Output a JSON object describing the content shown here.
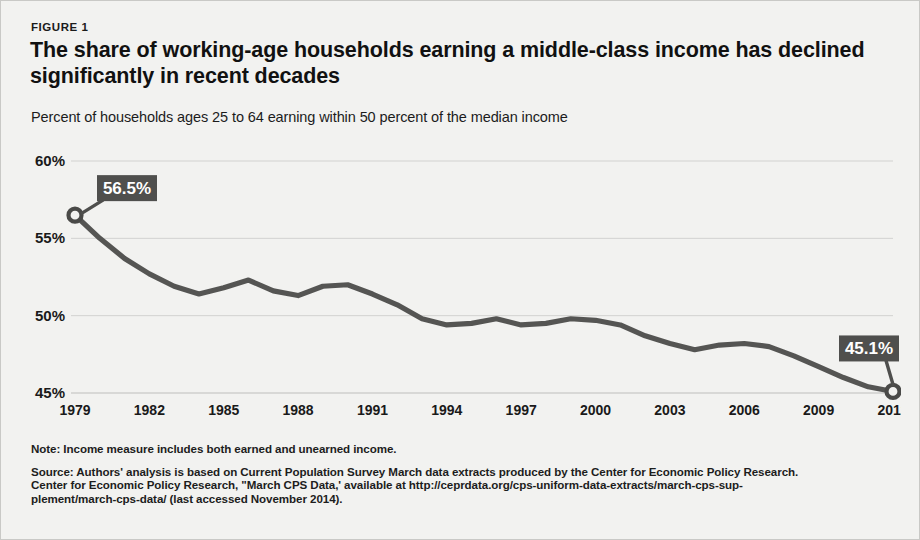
{
  "figure": {
    "label": "FIGURE 1",
    "title": "The share of working-age households earning a middle-class income has declined significantly in recent decades",
    "subtitle": "Percent of households ages 25 to 64 earning within 50 percent of the median income"
  },
  "notes": {
    "note": "Note:  Income measure includes both earned and unearned income.",
    "source_line_1": "Source: Authors' analysis is based on Current Population Survey March data extracts produced by the Center for Economic Policy Research.",
    "source_line_2": "Center for Economic Policy Research, \"March CPS Data,' available at http://ceprdata.org/cps-uniform-data-extracts/march-cps-sup-",
    "source_line_3": "plement/march-cps-data/  (last accessed November 2014)."
  },
  "colors": {
    "line": "#555553",
    "callout_bg": "#4f4f4d",
    "callout_text": "#ffffff",
    "grid": "#d2d2d0",
    "background": "#f2f2f0",
    "text": "#1a1a1a"
  },
  "chart_data": {
    "type": "line",
    "title": "The share of working-age households earning a middle-class income has declined significantly in recent decades",
    "subtitle": "Percent of households ages 25 to 64 earning within 50 percent of the median income",
    "xlabel": "",
    "ylabel": "",
    "ylim": [
      45,
      60
    ],
    "yticks": [
      45,
      50,
      55,
      60
    ],
    "ytick_labels": [
      "45%",
      "50%",
      "55%",
      "60%"
    ],
    "xlim": [
      1979,
      2012
    ],
    "xticks": [
      1979,
      1982,
      1985,
      1988,
      1991,
      1994,
      1997,
      2000,
      2003,
      2006,
      2009,
      2012
    ],
    "xtick_labels": [
      "1979",
      "1982",
      "1985",
      "1988",
      "1991",
      "1994",
      "1997",
      "2000",
      "2003",
      "2006",
      "2009",
      "2012"
    ],
    "grid": true,
    "legend": false,
    "x": [
      1979,
      1980,
      1981,
      1982,
      1983,
      1984,
      1985,
      1986,
      1987,
      1988,
      1989,
      1990,
      1991,
      1992,
      1993,
      1994,
      1995,
      1996,
      1997,
      1998,
      1999,
      2000,
      2001,
      2002,
      2003,
      2004,
      2005,
      2006,
      2007,
      2008,
      2009,
      2010,
      2011,
      2012
    ],
    "values": [
      56.5,
      55.0,
      53.7,
      52.7,
      51.9,
      51.4,
      51.8,
      52.3,
      51.6,
      51.3,
      51.9,
      52.0,
      51.4,
      50.7,
      49.8,
      49.4,
      49.5,
      49.8,
      49.4,
      49.5,
      49.8,
      49.7,
      49.4,
      48.7,
      48.2,
      47.8,
      48.1,
      48.2,
      48.0,
      47.4,
      46.7,
      46.0,
      45.4,
      45.1
    ],
    "annotations": [
      {
        "name": "start-value",
        "label": "56.5%",
        "x": 1979,
        "y": 56.5
      },
      {
        "name": "end-value",
        "label": "45.1%",
        "x": 2012,
        "y": 45.1
      }
    ],
    "markers": [
      {
        "x": 1979,
        "y": 56.5
      },
      {
        "x": 2012,
        "y": 45.1
      }
    ]
  }
}
